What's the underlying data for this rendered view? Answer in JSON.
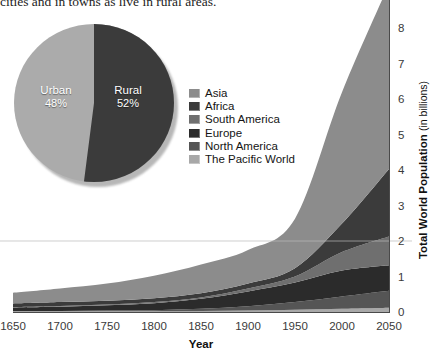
{
  "intro_text": "cities and in towns as live in rural areas.",
  "pie": {
    "title": "Urban vs Rural share of world population",
    "slices": [
      {
        "label": "Urban",
        "percent_label": "48%",
        "value": 48,
        "color": "#ababab"
      },
      {
        "label": "Rural",
        "percent_label": "52%",
        "value": 52,
        "color": "#3b3b3b"
      }
    ]
  },
  "legend": {
    "items": [
      {
        "label": "Asia",
        "color": "#8c8c8c"
      },
      {
        "label": "Africa",
        "color": "#3b3b3b"
      },
      {
        "label": "South America",
        "color": "#6f6f6f"
      },
      {
        "label": "Europe",
        "color": "#2b2b2b"
      },
      {
        "label": "North America",
        "color": "#555555"
      },
      {
        "label": "The Pacific World",
        "color": "#a8a8a8"
      }
    ]
  },
  "chart_data": {
    "type": "area",
    "stacked": true,
    "title": "",
    "xlabel": "Year",
    "ylabel": "Total World Population",
    "ylabel_suffix": "(in billions)",
    "x": [
      1650,
      1700,
      1750,
      1800,
      1850,
      1900,
      1950,
      2000,
      2050
    ],
    "xticks": [
      "1650",
      "1700",
      "1750",
      "1800",
      "1850",
      "1900",
      "1950",
      "2000",
      "2050"
    ],
    "yticks": [
      "0",
      "1",
      "2",
      "3",
      "4",
      "5",
      "6",
      "7",
      "8"
    ],
    "xlim": [
      1650,
      2050
    ],
    "ylim": [
      0,
      8.6
    ],
    "grid": false,
    "legend_position": "inside-upper-left",
    "series": [
      {
        "name": "The Pacific World",
        "color": "#a8a8a8",
        "values": [
          0.02,
          0.02,
          0.02,
          0.02,
          0.03,
          0.04,
          0.06,
          0.09,
          0.12
        ]
      },
      {
        "name": "North America",
        "color": "#555555",
        "values": [
          0.01,
          0.01,
          0.02,
          0.03,
          0.06,
          0.12,
          0.22,
          0.35,
          0.48
        ]
      },
      {
        "name": "Europe",
        "color": "#2b2b2b",
        "values": [
          0.1,
          0.12,
          0.15,
          0.2,
          0.28,
          0.42,
          0.55,
          0.73,
          0.72
        ]
      },
      {
        "name": "South America",
        "color": "#6f6f6f",
        "values": [
          0.01,
          0.02,
          0.02,
          0.03,
          0.04,
          0.08,
          0.17,
          0.52,
          0.81
        ]
      },
      {
        "name": "Africa",
        "color": "#3b3b3b",
        "values": [
          0.1,
          0.11,
          0.11,
          0.11,
          0.12,
          0.14,
          0.23,
          0.8,
          1.9
        ]
      },
      {
        "name": "Asia",
        "color": "#8c8c8c",
        "values": [
          0.3,
          0.38,
          0.48,
          0.63,
          0.81,
          0.95,
          1.4,
          3.7,
          5.2
        ]
      }
    ],
    "totals": [
      0.54,
      0.66,
      0.8,
      1.02,
      1.34,
      1.75,
      2.63,
      6.19,
      9.23
    ]
  }
}
